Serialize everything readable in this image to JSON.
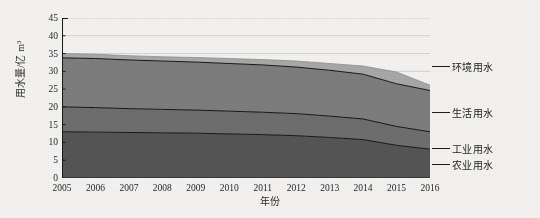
{
  "chart_data": {
    "type": "area",
    "stacked": true,
    "title": "",
    "xlabel": "年份",
    "ylabel": "用水量/亿 m³",
    "x": [
      2005,
      2006,
      2007,
      2008,
      2009,
      2010,
      2011,
      2012,
      2013,
      2014,
      2015,
      2016
    ],
    "xtick_labels": [
      "2005",
      "2006",
      "2007",
      "2008",
      "2009",
      "2010",
      "2011",
      "2012",
      "2013",
      "2014",
      "2015",
      "2016"
    ],
    "ylim": [
      0,
      45
    ],
    "yticks": [
      0,
      5,
      10,
      15,
      20,
      25,
      30,
      35,
      40,
      45
    ],
    "ytick_labels": [
      "0",
      "5",
      "10",
      "15",
      "20",
      "25",
      "30",
      "35",
      "40",
      "45"
    ],
    "grid": "horizontal-light",
    "legend_position": "right-outside",
    "series": [
      {
        "name": "农业用水",
        "color": "#555555",
        "values": [
          13.0,
          12.9,
          12.8,
          12.7,
          12.6,
          12.4,
          12.2,
          11.9,
          11.4,
          10.8,
          9.2,
          8.1
        ]
      },
      {
        "name": "工业用水",
        "color": "#6e6e6e",
        "values": [
          7.0,
          6.9,
          6.7,
          6.6,
          6.5,
          6.4,
          6.3,
          6.2,
          6.0,
          5.8,
          5.3,
          4.9
        ]
      },
      {
        "name": "生活用水",
        "color": "#7d7d7d",
        "values": [
          13.8,
          13.8,
          13.7,
          13.6,
          13.5,
          13.4,
          13.3,
          13.1,
          12.9,
          12.6,
          12.0,
          11.6
        ]
      },
      {
        "name": "环境用水",
        "color": "#a8a8a8",
        "values": [
          1.2,
          1.2,
          1.2,
          1.2,
          1.3,
          1.4,
          1.5,
          1.7,
          1.9,
          2.3,
          3.3,
          1.5
        ]
      }
    ],
    "cumulative_top": [
      35.0,
      34.8,
      34.4,
      34.1,
      33.9,
      33.6,
      33.3,
      32.9,
      32.2,
      31.5,
      29.8,
      26.1
    ]
  },
  "legend": {
    "items": [
      {
        "label": "环境用水"
      },
      {
        "label": "生活用水"
      },
      {
        "label": "工业用水"
      },
      {
        "label": "农业用水"
      }
    ]
  }
}
